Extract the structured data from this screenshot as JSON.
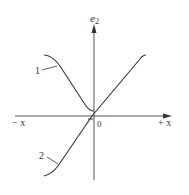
{
  "figure": {
    "y_axis_label": "e",
    "y_axis_subscript": "2",
    "x_axis_negative_label": "− x",
    "x_axis_positive_label": "+ x",
    "origin_label": "0",
    "curves": [
      {
        "id": "1",
        "label": "1"
      },
      {
        "id": "2",
        "label": "2"
      }
    ],
    "colors": {
      "stroke": "#333333",
      "axis": "#555555"
    }
  }
}
